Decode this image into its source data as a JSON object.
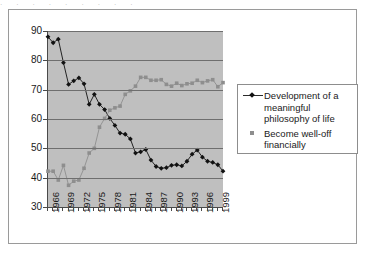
{
  "figure": {
    "top_sliver_text": "·  ·   ·    ·   ·     ·    ·  ·   ·"
  },
  "legend": {
    "position": "right",
    "entries": [
      {
        "id": "philosophy",
        "label": "Development of a meaningful philosophy of life",
        "marker": "line-diamond-icon",
        "color": "#111111"
      },
      {
        "id": "wealth",
        "label": "Become well-off financially",
        "marker": "square-icon",
        "color": "#8e8e8e"
      }
    ]
  },
  "chart_data": {
    "type": "line",
    "title": "",
    "subtitle": "",
    "xlabel": "",
    "ylabel": "",
    "xlim": [
      1966,
      2000
    ],
    "ylim": [
      30,
      90
    ],
    "yticks": [
      30,
      40,
      50,
      60,
      70,
      80,
      90
    ],
    "ytick_labels": [
      "30",
      "40",
      "50",
      "60",
      "70",
      "80",
      "90"
    ],
    "grid": true,
    "grid_axis": "y",
    "plot_background": "#bfbfbf",
    "x": [
      1966,
      1967,
      1968,
      1969,
      1970,
      1971,
      1972,
      1973,
      1974,
      1975,
      1976,
      1977,
      1978,
      1979,
      1980,
      1981,
      1982,
      1983,
      1984,
      1985,
      1986,
      1987,
      1988,
      1989,
      1990,
      1991,
      1992,
      1993,
      1994,
      1995,
      1996,
      1997,
      1998,
      1999,
      2000
    ],
    "xtick_labels": [
      "1966",
      "1969",
      "1972",
      "1975",
      "1978",
      "1981",
      "1984",
      "1987",
      "1990",
      "1993",
      "1996",
      "1999"
    ],
    "xtick_interval": 3,
    "series": [
      {
        "name": "Development of a meaningful philosophy of life",
        "color": "#111111",
        "marker": "diamond",
        "values": [
          88.0,
          86.0,
          87.2,
          79.2,
          71.8,
          73.0,
          74.0,
          72.0,
          65.0,
          68.4,
          65.0,
          63.2,
          60.2,
          57.8,
          55.2,
          54.8,
          53.2,
          48.4,
          48.8,
          49.6,
          46.0,
          43.8,
          43.2,
          43.4,
          44.2,
          44.4,
          44.0,
          45.6,
          48.0,
          49.4,
          47.0,
          45.6,
          45.2,
          44.4,
          42.2
        ]
      },
      {
        "name": "Become well-off financially",
        "color": "#8e8e8e",
        "marker": "square",
        "values": [
          42.2,
          42.2,
          39.2,
          44.2,
          37.4,
          38.8,
          39.2,
          43.2,
          48.4,
          50.0,
          57.2,
          60.2,
          63.0,
          63.8,
          64.4,
          68.4,
          69.6,
          71.2,
          74.2,
          74.2,
          73.2,
          73.2,
          73.4,
          71.8,
          71.2,
          72.2,
          71.4,
          72.0,
          72.2,
          73.2,
          72.4,
          73.0,
          73.4,
          71.0,
          72.4
        ]
      }
    ]
  }
}
